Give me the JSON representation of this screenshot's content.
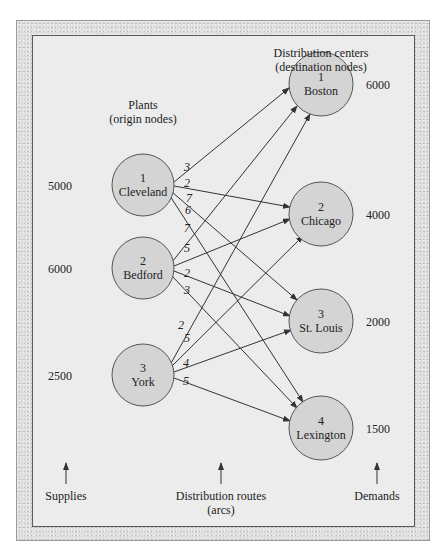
{
  "figure": {
    "origin_heading": {
      "line1": "Plants",
      "line2": "(origin nodes)"
    },
    "dest_heading": {
      "line1": "Distribution centers",
      "line2": "(destination nodes)"
    },
    "bottom_labels": {
      "supplies": "Supplies",
      "routes_line1": "Distribution routes",
      "routes_line2": "(arcs)",
      "demands": "Demands"
    }
  },
  "origins": [
    {
      "number": "1",
      "name": "Cleveland",
      "supply": "5000"
    },
    {
      "number": "2",
      "name": "Bedford",
      "supply": "6000"
    },
    {
      "number": "3",
      "name": "York",
      "supply": "2500"
    }
  ],
  "destinations": [
    {
      "number": "1",
      "name": "Boston",
      "demand": "6000"
    },
    {
      "number": "2",
      "name": "Chicago",
      "demand": "4000"
    },
    {
      "number": "3",
      "name": "St. Louis",
      "demand": "2000"
    },
    {
      "number": "4",
      "name": "Lexington",
      "demand": "1500"
    }
  ],
  "arcs": [
    {
      "from": "Cleveland",
      "to": "Boston",
      "cost": "3"
    },
    {
      "from": "Cleveland",
      "to": "Chicago",
      "cost": "2"
    },
    {
      "from": "Cleveland",
      "to": "St. Louis",
      "cost": "7"
    },
    {
      "from": "Cleveland",
      "to": "Lexington",
      "cost": "6"
    },
    {
      "from": "Bedford",
      "to": "Boston",
      "cost": "7"
    },
    {
      "from": "Bedford",
      "to": "Chicago",
      "cost": "5"
    },
    {
      "from": "Bedford",
      "to": "St. Louis",
      "cost": "2"
    },
    {
      "from": "Bedford",
      "to": "Lexington",
      "cost": "3"
    },
    {
      "from": "York",
      "to": "Boston",
      "cost": "2"
    },
    {
      "from": "York",
      "to": "Chicago",
      "cost": "5"
    },
    {
      "from": "York",
      "to": "St. Louis",
      "cost": "4"
    },
    {
      "from": "York",
      "to": "Lexington",
      "cost": "5"
    }
  ],
  "colors": {
    "node_fill": "#d4d4d4",
    "node_stroke": "#555555",
    "arc": "#333333",
    "panel": "#ececec"
  }
}
